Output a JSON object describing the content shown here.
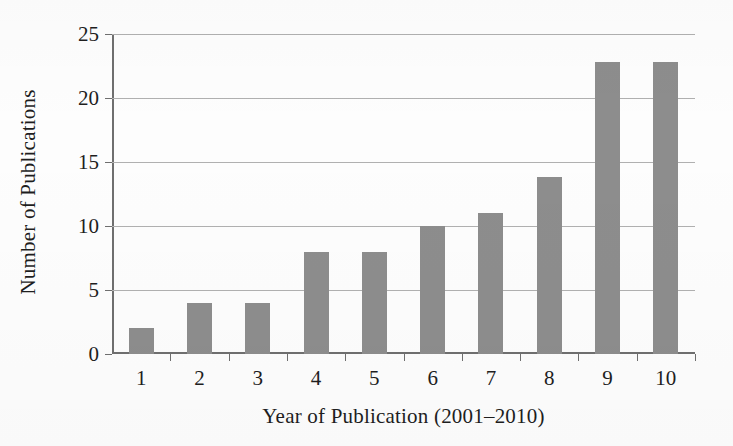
{
  "chart_data": {
    "type": "bar",
    "title": "",
    "xlabel": "Year of Publication (2001–2010)",
    "ylabel": "Number of Publications",
    "categories": [
      "1",
      "2",
      "3",
      "4",
      "5",
      "6",
      "7",
      "8",
      "9",
      "10"
    ],
    "values": [
      2,
      4,
      4,
      8,
      8,
      10,
      11,
      13.8,
      22.8,
      22.8
    ],
    "ylim": [
      0,
      25
    ],
    "yticks": [
      0,
      5,
      10,
      15,
      20,
      25
    ],
    "ytick_labels": [
      "0",
      "5",
      "10",
      "15",
      "20",
      "25"
    ],
    "xtick_labels": [
      "1",
      "2",
      "3",
      "4",
      "5",
      "6",
      "7",
      "8",
      "9",
      "10"
    ],
    "grid": true,
    "legend": "none",
    "bar_color": "#8d8d8d",
    "gridline_color": "#b0b0b0",
    "axis_color": "#6f6f6f",
    "background_color": "#fdfdfd"
  }
}
